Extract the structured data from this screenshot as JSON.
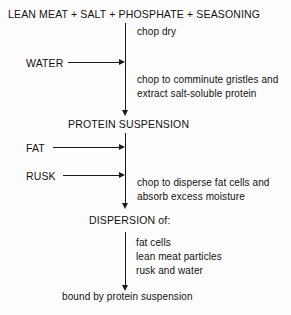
{
  "diagram": {
    "title": "LEAN MEAT + SALT + PHOSPHATE + SEASONING",
    "header": "LEAN MEAT + SALT + PHOSPHATE + SEASONING",
    "stage_protein_suspension": "PROTEIN SUSPENSION",
    "stage_dispersion": "DISPERSION of:",
    "final_line": "bound by protein suspension",
    "inputs": {
      "water": "WATER",
      "fat": "FAT",
      "rusk": "RUSK"
    },
    "steps": {
      "chop_dry": "chop dry",
      "comminute_line1": "chop to comminute gristles and",
      "comminute_line2": "extract salt-soluble protein",
      "disperse_line1": "chop to disperse fat cells and",
      "disperse_line2": "absorb excess moisture"
    },
    "dispersion_items": [
      "fat cells",
      "lean meat particles",
      "rusk and water"
    ],
    "colors": {
      "ink": "#1a1a1a",
      "background": "#fdfdfd"
    }
  }
}
